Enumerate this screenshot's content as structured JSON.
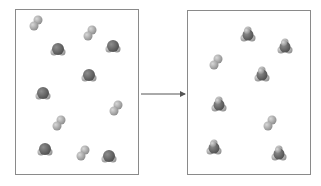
{
  "diagram": {
    "type": "reaction-particle-diagram",
    "colors": {
      "light_atom": "#a9a9a9",
      "dark_atom": "#6e6e6e",
      "border": "#8a8a8a",
      "arrow": "#555555"
    },
    "left_box": {
      "label": "reactants",
      "molecules": [
        {
          "kind": "diatomic",
          "x": 36,
          "y": 23
        },
        {
          "kind": "diatomic",
          "x": 90,
          "y": 33
        },
        {
          "kind": "bent",
          "x": 58,
          "y": 50
        },
        {
          "kind": "bent",
          "x": 113,
          "y": 47
        },
        {
          "kind": "bent",
          "x": 89,
          "y": 76
        },
        {
          "kind": "bent",
          "x": 43,
          "y": 94
        },
        {
          "kind": "diatomic",
          "x": 116,
          "y": 108
        },
        {
          "kind": "diatomic",
          "x": 59,
          "y": 123
        },
        {
          "kind": "bent",
          "x": 45,
          "y": 150
        },
        {
          "kind": "diatomic",
          "x": 83,
          "y": 153
        },
        {
          "kind": "bent",
          "x": 109,
          "y": 157
        }
      ]
    },
    "arrow": {
      "x1": 141,
      "y1": 94,
      "x2": 185,
      "y2": 94
    },
    "right_box": {
      "label": "products",
      "molecules": [
        {
          "kind": "tetra",
          "x": 248,
          "y": 35
        },
        {
          "kind": "tetra",
          "x": 285,
          "y": 47
        },
        {
          "kind": "diatomic",
          "x": 216,
          "y": 62
        },
        {
          "kind": "tetra",
          "x": 262,
          "y": 75
        },
        {
          "kind": "tetra",
          "x": 219,
          "y": 105
        },
        {
          "kind": "diatomic",
          "x": 270,
          "y": 123
        },
        {
          "kind": "tetra",
          "x": 214,
          "y": 148
        },
        {
          "kind": "tetra",
          "x": 279,
          "y": 154
        }
      ]
    }
  }
}
